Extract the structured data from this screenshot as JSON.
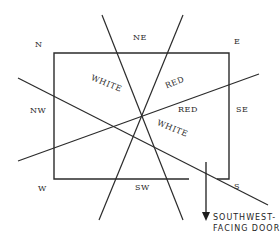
{
  "diagram": {
    "type": "compass-zone floor plan",
    "line_color": "#2b2b2b",
    "directions": {
      "n": "N",
      "ne": "NE",
      "e": "E",
      "nw": "NW",
      "se": "SE",
      "w": "W",
      "sw": "SW",
      "s": "S"
    },
    "zones": {
      "upper_left": "WHITE",
      "upper_right": "RED",
      "right": "RED",
      "lower_right": "WHITE"
    },
    "door": {
      "line1": "SOUTHWEST-",
      "line2": "FACING DOOR"
    }
  }
}
